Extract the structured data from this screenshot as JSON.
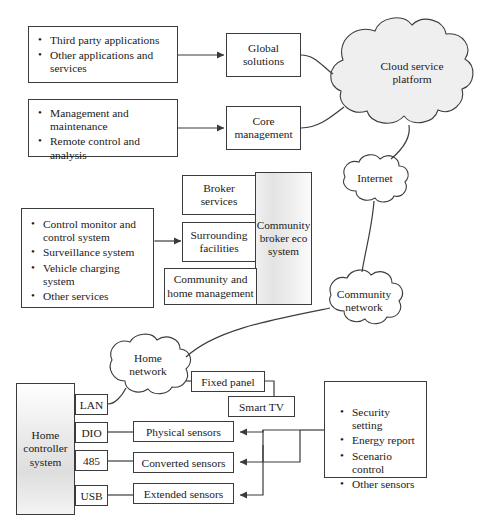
{
  "diagram": {
    "cloud_service_platform": {
      "label": "Cloud service\nplatform",
      "line1": "Cloud service",
      "line2": "platform"
    },
    "internet": {
      "label": "Internet"
    },
    "community_network": {
      "line1": "Community",
      "line2": "network"
    },
    "home_network": {
      "line1": "Home",
      "line2": "network"
    },
    "applications_box": {
      "items": [
        "Third party applications",
        "Other applications and services"
      ]
    },
    "management_box": {
      "items": [
        "Management and maintenance",
        "Remote control and analysis"
      ]
    },
    "services_box": {
      "items": [
        "Control monitor and control system",
        "Surveillance system",
        "Vehicle charging system",
        "Other services"
      ]
    },
    "features_box": {
      "items": [
        "Security setting",
        "Energy report",
        "Scenario control",
        "Other sensors"
      ]
    },
    "global_solutions": {
      "line1": "Global",
      "line2": "solutions"
    },
    "core_management": {
      "line1": "Core",
      "line2": "management"
    },
    "broker_services": {
      "line1": "Broker",
      "line2": "services"
    },
    "surrounding_facilities": {
      "line1": "Surrounding",
      "line2": "facilities"
    },
    "community_home_management": {
      "line1": "Community and",
      "line2": "home management"
    },
    "community_broker_eco_system": {
      "line1": "Community",
      "line2": "broker eco",
      "line3": "system"
    },
    "home_controller_system": {
      "line1": "Home",
      "line2": "controller",
      "line3": "system"
    },
    "ports": [
      {
        "label": "LAN"
      },
      {
        "label": "DIO"
      },
      {
        "label": "485"
      },
      {
        "label": "USB"
      }
    ],
    "sensors": [
      {
        "label": "Physical sensors"
      },
      {
        "label": "Converted sensors"
      },
      {
        "label": "Extended sensors"
      }
    ],
    "fixed_panel": {
      "label": "Fixed panel"
    },
    "smart_tv": {
      "label": "Smart TV"
    },
    "colors": {
      "stroke": "#3b3b3b",
      "cloud_fill": "#efefef",
      "panel_gradient_light": "#ffffff",
      "panel_gradient_dark": "#dedede",
      "background": "#ffffff"
    }
  }
}
